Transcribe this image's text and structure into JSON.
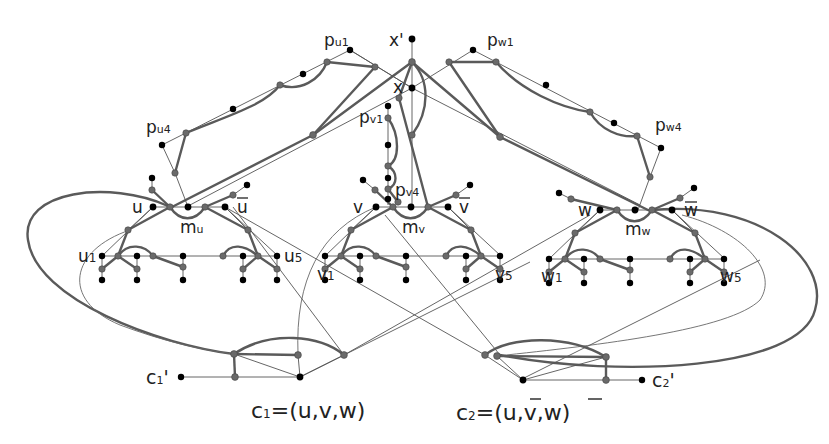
{
  "diagram": {
    "type": "graph-reduction-gadget",
    "colors": {
      "black_vertex": "#000000",
      "gray_vertex": "#6a6a6a",
      "edge": "#5a5a5a",
      "background": "#ffffff"
    },
    "labels": {
      "x_prime": "x'",
      "x": "x",
      "p_u1": "p",
      "p_u1_sub": "u1",
      "p_u4": "p",
      "p_u4_sub": "u4",
      "p_w1": "p",
      "p_w1_sub": "w1",
      "p_w4": "p",
      "p_w4_sub": "w4",
      "p_v1": "p",
      "p_v1_sub": "v1",
      "p_v4": "p",
      "p_v4_sub": "v4",
      "u": "u",
      "u_bar": "u",
      "v": "v",
      "v_bar": "v",
      "w": "w",
      "w_bar": "w",
      "m_u": "m",
      "m_u_sub": "u",
      "m_v": "m",
      "m_v_sub": "v",
      "m_w": "m",
      "m_w_sub": "w",
      "u1": "u",
      "u1_sub": "1",
      "u5": "u",
      "u5_sub": "5",
      "v1": "v",
      "v1_sub": "1",
      "v5": "v",
      "v5_sub": "5",
      "w1": "w",
      "w1_sub": "1",
      "w5": "w",
      "w5_sub": "5",
      "c1_prime": "c",
      "c1_prime_sub": "1",
      "c1_prime_mark": "'",
      "c2_prime": "c",
      "c2_prime_sub": "2",
      "c2_prime_mark": "'",
      "clause1": {
        "name": "c",
        "sub": "1",
        "eq": "=(u,v,w)"
      },
      "clause2": {
        "name": "c",
        "sub": "2",
        "eq_prefix": "=(",
        "lit1": "u",
        "sep1": ",v,",
        "lit3": "w",
        "eq_suffix": ")"
      }
    },
    "clauses": [
      {
        "id": "c1",
        "literals": [
          "u",
          "v",
          "w"
        ]
      },
      {
        "id": "c2",
        "literals": [
          "ū",
          "v",
          "w̄"
        ]
      }
    ],
    "variable_gadgets": [
      "u",
      "v",
      "w"
    ]
  }
}
